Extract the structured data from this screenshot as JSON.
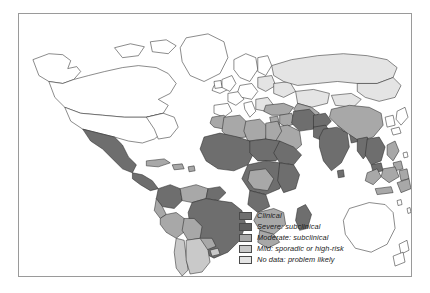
{
  "figure": {
    "frame_color": "#9a9a9a",
    "background": "#ffffff",
    "outline_color": "#2b2b2b"
  },
  "legend": {
    "items": [
      {
        "label": "Clinical",
        "color": "#6e6e6e",
        "key": "clinical"
      },
      {
        "label": "Severe: subclinical",
        "color": "#5f5f5f",
        "key": "severe-subclinical"
      },
      {
        "label": "Moderate: subclinical",
        "color": "#a8a8a8",
        "key": "moderate-subclinical"
      },
      {
        "label": "Mild: sporadic or high-risk",
        "color": "#c9c9c9",
        "key": "mild-sporadic-high-risk"
      },
      {
        "label": "No data: problem likely",
        "color": "#e4e4e4",
        "key": "no-data-problem-likely"
      }
    ]
  },
  "map_data": {
    "type": "choropleth",
    "projection": "equirectangular",
    "regions": [
      {
        "name": "Canada",
        "category": "none"
      },
      {
        "name": "United States",
        "category": "none"
      },
      {
        "name": "Greenland",
        "category": "none"
      },
      {
        "name": "Mexico",
        "category": "clinical"
      },
      {
        "name": "Central America",
        "category": "clinical"
      },
      {
        "name": "Caribbean",
        "category": "moderate-subclinical"
      },
      {
        "name": "Colombia",
        "category": "clinical"
      },
      {
        "name": "Venezuela",
        "category": "moderate-subclinical"
      },
      {
        "name": "Brazil",
        "category": "clinical"
      },
      {
        "name": "Peru",
        "category": "moderate-subclinical"
      },
      {
        "name": "Bolivia",
        "category": "moderate-subclinical"
      },
      {
        "name": "Chile",
        "category": "mild-sporadic-high-risk"
      },
      {
        "name": "Argentina",
        "category": "mild-sporadic-high-risk"
      },
      {
        "name": "Morocco",
        "category": "moderate-subclinical"
      },
      {
        "name": "Algeria",
        "category": "moderate-subclinical"
      },
      {
        "name": "Libya",
        "category": "moderate-subclinical"
      },
      {
        "name": "Egypt",
        "category": "moderate-subclinical"
      },
      {
        "name": "Sahel",
        "category": "clinical"
      },
      {
        "name": "West Africa",
        "category": "clinical"
      },
      {
        "name": "Central Africa",
        "category": "clinical"
      },
      {
        "name": "East Africa",
        "category": "clinical"
      },
      {
        "name": "Southern Africa",
        "category": "moderate-subclinical"
      },
      {
        "name": "Madagascar",
        "category": "clinical"
      },
      {
        "name": "Europe",
        "category": "none"
      },
      {
        "name": "Eastern Europe",
        "category": "no-data-problem-likely"
      },
      {
        "name": "Turkey",
        "category": "moderate-subclinical"
      },
      {
        "name": "Arabian Peninsula",
        "category": "moderate-subclinical"
      },
      {
        "name": "Iran",
        "category": "clinical"
      },
      {
        "name": "Russia",
        "category": "no-data-problem-likely"
      },
      {
        "name": "Kazakhstan",
        "category": "no-data-problem-likely"
      },
      {
        "name": "Central Asia",
        "category": "moderate-subclinical"
      },
      {
        "name": "China",
        "category": "moderate-subclinical"
      },
      {
        "name": "Mongolia",
        "category": "no-data-problem-likely"
      },
      {
        "name": "India",
        "category": "clinical"
      },
      {
        "name": "Pakistan",
        "category": "clinical"
      },
      {
        "name": "Bangladesh",
        "category": "clinical"
      },
      {
        "name": "Myanmar",
        "category": "clinical"
      },
      {
        "name": "Thailand",
        "category": "clinical"
      },
      {
        "name": "Vietnam",
        "category": "clinical"
      },
      {
        "name": "Indonesia",
        "category": "moderate-subclinical"
      },
      {
        "name": "Philippines",
        "category": "moderate-subclinical"
      },
      {
        "name": "Papua New Guinea",
        "category": "moderate-subclinical"
      },
      {
        "name": "Japan",
        "category": "none"
      },
      {
        "name": "Korea",
        "category": "none"
      },
      {
        "name": "Australia",
        "category": "none"
      },
      {
        "name": "New Zealand",
        "category": "none"
      }
    ]
  }
}
